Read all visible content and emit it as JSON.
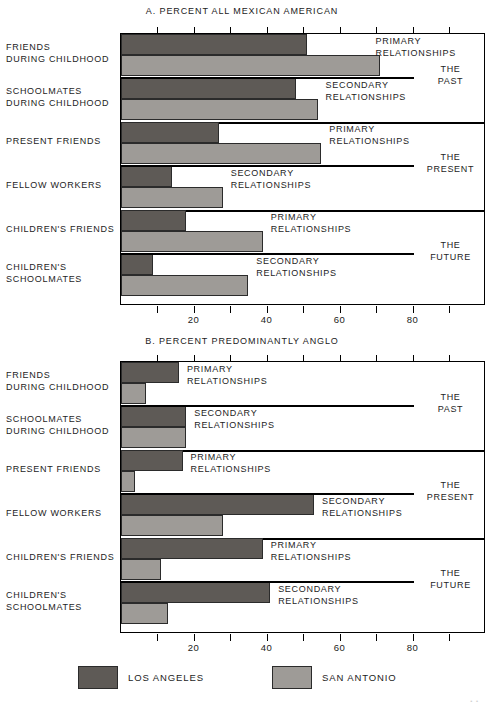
{
  "figure": {
    "background": "#ffffff",
    "series_colors": {
      "los_angeles": "#5e5a56",
      "san_antonio": "#9e9b97"
    }
  },
  "legend": {
    "items": [
      {
        "label": "LOS ANGELES",
        "color": "#5e5a56"
      },
      {
        "label": "SAN ANTONIO",
        "color": "#9e9b97"
      }
    ]
  },
  "panel_a": {
    "title": "A.  PERCENT ALL MEXICAN AMERICAN",
    "row_labels": [
      "FRIENDS\nDURING CHILDHOOD",
      "SCHOOLMATES\nDURING CHILDHOOD",
      "PRESENT FRIENDS",
      "FELLOW WORKERS",
      "CHILDREN'S FRIENDS",
      "CHILDREN'S\nSCHOOLMATES"
    ],
    "row_labels_l1": [
      "FRIENDS",
      "SCHOOLMATES",
      "PRESENT FRIENDS",
      "FELLOW WORKERS",
      "CHILDREN'S FRIENDS",
      "CHILDREN'S"
    ],
    "row_labels_l2": [
      "DURING CHILDHOOD",
      "DURING CHILDHOOD",
      "",
      "",
      "",
      "SCHOOLMATES"
    ],
    "inner_notes": [
      "PRIMARY\nRELATIONSHIPS",
      "SECONDARY\nRELATIONSHIPS",
      "PRIMARY\nRELATIONSHIPS",
      "SECONDARY\nRELATIONSHIPS",
      "PRIMARY\nRELATIONSHIPS",
      "SECONDARY\nRELATIONSHIPS"
    ],
    "note_l1": [
      "PRIMARY",
      "SECONDARY",
      "PRIMARY",
      "SECONDARY",
      "PRIMARY",
      "SECONDARY"
    ],
    "note_l2": [
      "RELATIONSHIPS",
      "RELATIONSHIPS",
      "RELATIONSHIPS",
      "RELATIONSHIPS",
      "RELATIONSHIPS",
      "RELATIONSHIPS"
    ],
    "era_labels": [
      "THE\nPAST",
      "THE\nPRESENT",
      "THE\nFUTURE"
    ],
    "era_l1": [
      "THE",
      "THE",
      "THE"
    ],
    "era_l2": [
      "PAST",
      "PRESENT",
      "FUTURE"
    ]
  },
  "panel_b": {
    "title": "B.  PERCENT PREDOMINANTLY ANGLO",
    "row_labels_l1": [
      "FRIENDS",
      "SCHOOLMATES",
      "PRESENT FRIENDS",
      "FELLOW WORKERS",
      "CHILDREN'S FRIENDS",
      "CHILDREN'S"
    ],
    "row_labels_l2": [
      "DURING CHILDHOOD",
      "DURING CHILDHOOD",
      "",
      "",
      "",
      "SCHOOLMATES"
    ],
    "note_l1": [
      "PRIMARY",
      "SECONDARY",
      "PRIMARY",
      "SECONDARY",
      "PRIMARY",
      "SECONDARY"
    ],
    "note_l2": [
      "RELATIONSHIPS",
      "RELATIONSHIPS",
      "RELATIONSHIPS",
      "RELATIONSHIPS",
      "RELATIONSHIPS",
      "RELATIONSHIPS"
    ],
    "era_l1": [
      "THE",
      "THE",
      "THE"
    ],
    "era_l2": [
      "PAST",
      "PRESENT",
      "FUTURE"
    ]
  },
  "chart_data": [
    {
      "type": "bar",
      "orientation": "horizontal",
      "title": "A.  PERCENT ALL MEXICAN AMERICAN",
      "xlabel": "",
      "ylabel": "",
      "xlim": [
        0,
        100
      ],
      "xticks": [
        0,
        10,
        20,
        30,
        40,
        50,
        60,
        70,
        80,
        90,
        100
      ],
      "xticklabels": [
        "",
        "",
        "20",
        "",
        "40",
        "",
        "60",
        "",
        "80",
        "",
        ""
      ],
      "grid": false,
      "legend_position": "below",
      "categories": [
        "FRIENDS DURING CHILDHOOD",
        "SCHOOLMATES DURING CHILDHOOD",
        "PRESENT FRIENDS",
        "FELLOW WORKERS",
        "CHILDREN'S FRIENDS",
        "CHILDREN'S SCHOOLMATES"
      ],
      "series": [
        {
          "name": "LOS ANGELES",
          "color": "#5e5a56",
          "values": [
            51,
            48,
            27,
            14,
            18,
            9
          ]
        },
        {
          "name": "SAN ANTONIO",
          "color": "#9e9b97",
          "values": [
            71,
            54,
            55,
            28,
            39,
            35
          ]
        }
      ],
      "annotations": [
        "PRIMARY RELATIONSHIPS",
        "SECONDARY RELATIONSHIPS",
        "PRIMARY RELATIONSHIPS",
        "SECONDARY RELATIONSHIPS",
        "PRIMARY RELATIONSHIPS",
        "SECONDARY RELATIONSHIPS",
        "THE PAST",
        "THE PRESENT",
        "THE FUTURE"
      ]
    },
    {
      "type": "bar",
      "orientation": "horizontal",
      "title": "B.  PERCENT PREDOMINANTLY ANGLO",
      "xlabel": "",
      "ylabel": "",
      "xlim": [
        0,
        100
      ],
      "xticks": [
        0,
        10,
        20,
        30,
        40,
        50,
        60,
        70,
        80,
        90,
        100
      ],
      "xticklabels": [
        "",
        "",
        "20",
        "",
        "40",
        "",
        "60",
        "",
        "80",
        "",
        ""
      ],
      "grid": false,
      "legend_position": "below",
      "categories": [
        "FRIENDS DURING CHILDHOOD",
        "SCHOOLMATES DURING CHILDHOOD",
        "PRESENT FRIENDS",
        "FELLOW WORKERS",
        "CHILDREN'S FRIENDS",
        "CHILDREN'S SCHOOLMATES"
      ],
      "series": [
        {
          "name": "LOS ANGELES",
          "color": "#5e5a56",
          "values": [
            16,
            18,
            17,
            53,
            39,
            41
          ]
        },
        {
          "name": "SAN ANTONIO",
          "color": "#9e9b97",
          "values": [
            7,
            18,
            4,
            28,
            11,
            13
          ]
        }
      ],
      "annotations": [
        "PRIMARY RELATIONSHIPS",
        "SECONDARY RELATIONSHIPS",
        "PRIMARY RELATIONSHIPS",
        "SECONDARY RELATIONSHIPS",
        "PRIMARY RELATIONSHIPS",
        "SECONDARY RELATIONSHIPS",
        "THE PAST",
        "THE PRESENT",
        "THE FUTURE"
      ]
    }
  ]
}
